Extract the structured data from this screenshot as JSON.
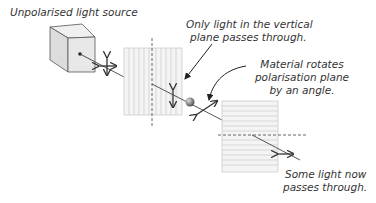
{
  "labels": {
    "source": "Unpolarised light source",
    "filter1_line1": "Only light in the vertical",
    "filter1_line2": "plane passes through.",
    "material_line1": "Material rotates",
    "material_line2": "polarisation plane",
    "material_line3": "by an angle.",
    "output_line1": "Some light now",
    "output_line2": "passes through."
  },
  "colors": {
    "stroke": "#333333",
    "filter_fill": "#f2f2f2",
    "filter_lines": "#bbbbbb",
    "cube_fill": "#e8e8e8"
  }
}
